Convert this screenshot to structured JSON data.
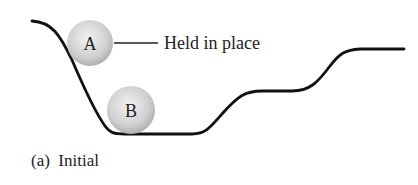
{
  "diagram": {
    "balls": [
      {
        "id": "A",
        "label": "A",
        "cx": 90,
        "cy": 43,
        "r": 23,
        "state": "Held in place"
      },
      {
        "id": "B",
        "label": "B",
        "cx": 131,
        "cy": 110,
        "r": 24
      }
    ],
    "annotation": {
      "text": "Held in place",
      "points_to": "A"
    },
    "caption": "(a)  Initial",
    "colors": {
      "curve": "#111111",
      "ball_center": "#eeeeee",
      "ball_edge": "#b5b5b5",
      "text": "#222222"
    }
  }
}
